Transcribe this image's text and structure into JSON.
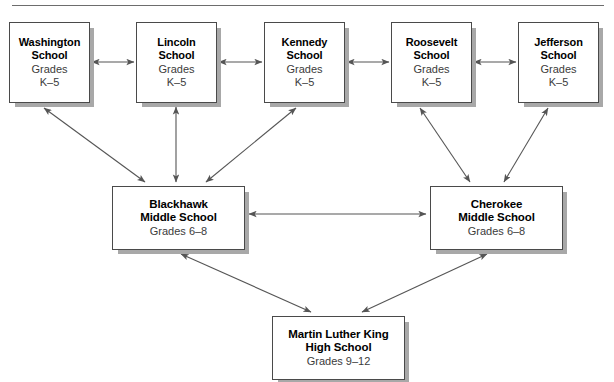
{
  "diagram": {
    "type": "organizational-hierarchy",
    "top_rule": true,
    "colors": {
      "box_fill": "#ffffff",
      "box_border": "#4a4a4a",
      "box_shadow": "#a8a8a8",
      "arrow": "#555555",
      "text": "#000000",
      "rule": "#6d6d6d"
    },
    "nodes": [
      {
        "id": "washington",
        "name_line1": "Washington",
        "name_line2": "School",
        "grades_line1": "Grades",
        "grades_line2": "K–5",
        "level": "elementary",
        "x": 9,
        "y": 22,
        "w": 81,
        "h": 81
      },
      {
        "id": "lincoln",
        "name_line1": "Lincoln",
        "name_line2": "School",
        "grades_line1": "Grades",
        "grades_line2": "K–5",
        "level": "elementary",
        "x": 136,
        "y": 22,
        "w": 81,
        "h": 81
      },
      {
        "id": "kennedy",
        "name_line1": "Kennedy",
        "name_line2": "School",
        "grades_line1": "Grades",
        "grades_line2": "K–5",
        "level": "elementary",
        "x": 264,
        "y": 22,
        "w": 81,
        "h": 81
      },
      {
        "id": "roosevelt",
        "name_line1": "Roosevelt",
        "name_line2": "School",
        "grades_line1": "Grades",
        "grades_line2": "K–5",
        "level": "elementary",
        "x": 391,
        "y": 22,
        "w": 81,
        "h": 81
      },
      {
        "id": "jefferson",
        "name_line1": "Jefferson",
        "name_line2": "School",
        "grades_line1": "Grades",
        "grades_line2": "K–5",
        "level": "elementary",
        "x": 518,
        "y": 22,
        "w": 81,
        "h": 81
      },
      {
        "id": "blackhawk",
        "name_line1": "Blackhawk",
        "name_line2": "Middle School",
        "grades_line1": "Grades 6–8",
        "grades_line2": "",
        "level": "middle",
        "x": 112,
        "y": 186,
        "w": 133,
        "h": 64
      },
      {
        "id": "cherokee",
        "name_line1": "Cherokee",
        "name_line2": "Middle School",
        "grades_line1": "Grades 6–8",
        "grades_line2": "",
        "level": "middle",
        "x": 430,
        "y": 186,
        "w": 133,
        "h": 64
      },
      {
        "id": "mlk",
        "name_line1": "Martin Luther King",
        "name_line2": "High School",
        "grades_line1": "Grades 9–12",
        "grades_line2": "",
        "level": "high",
        "x": 272,
        "y": 316,
        "w": 133,
        "h": 64
      }
    ],
    "edges": [
      {
        "from": "washington",
        "to": "lincoln",
        "style": "double-arrow",
        "orientation": "horizontal"
      },
      {
        "from": "lincoln",
        "to": "kennedy",
        "style": "double-arrow",
        "orientation": "horizontal"
      },
      {
        "from": "kennedy",
        "to": "roosevelt",
        "style": "double-arrow",
        "orientation": "horizontal"
      },
      {
        "from": "roosevelt",
        "to": "jefferson",
        "style": "double-arrow",
        "orientation": "horizontal"
      },
      {
        "from": "washington",
        "to": "blackhawk",
        "style": "double-arrow",
        "orientation": "diagonal"
      },
      {
        "from": "lincoln",
        "to": "blackhawk",
        "style": "double-arrow",
        "orientation": "vertical"
      },
      {
        "from": "kennedy",
        "to": "blackhawk",
        "style": "double-arrow",
        "orientation": "diagonal"
      },
      {
        "from": "roosevelt",
        "to": "cherokee",
        "style": "double-arrow",
        "orientation": "diagonal"
      },
      {
        "from": "jefferson",
        "to": "cherokee",
        "style": "double-arrow",
        "orientation": "diagonal"
      },
      {
        "from": "blackhawk",
        "to": "cherokee",
        "style": "double-arrow",
        "orientation": "horizontal"
      },
      {
        "from": "blackhawk",
        "to": "mlk",
        "style": "double-arrow",
        "orientation": "diagonal"
      },
      {
        "from": "cherokee",
        "to": "mlk",
        "style": "double-arrow",
        "orientation": "diagonal"
      }
    ]
  }
}
